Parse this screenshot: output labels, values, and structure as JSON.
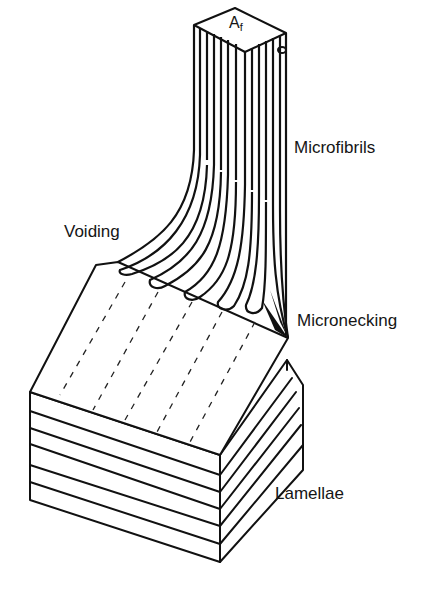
{
  "figure": {
    "labels": {
      "top_face": "A",
      "top_face_subscript": "f",
      "microfibrils": "Microfibrils",
      "voiding": "Voiding",
      "micronecking": "Micronecking",
      "lamellae": "Lamellae"
    },
    "colors": {
      "line": "#111111",
      "background": "#ffffff",
      "text": "#151515"
    }
  }
}
